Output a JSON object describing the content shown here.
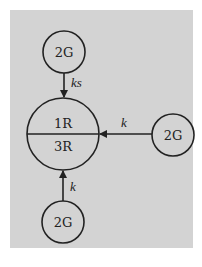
{
  "diagram": {
    "background_color": "#d3d3d3",
    "line_color": "#222222",
    "nodes": {
      "center": {
        "top_label": "1R",
        "bottom_label": "3R"
      },
      "top": {
        "label": "2G"
      },
      "right": {
        "label": "2G"
      },
      "bottom": {
        "label": "2G"
      }
    },
    "edges": {
      "top_to_center": {
        "label": "ks"
      },
      "right_to_center": {
        "label": "k"
      },
      "bottom_to_center": {
        "label": "k"
      }
    }
  }
}
